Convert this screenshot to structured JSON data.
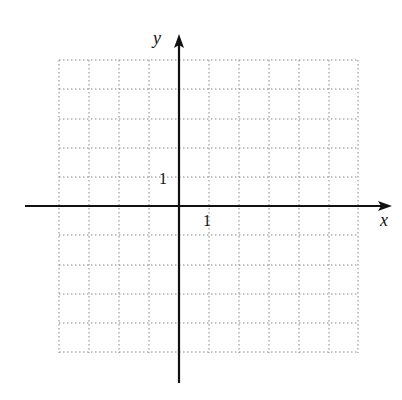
{
  "figure": {
    "type": "coordinate-grid",
    "axes": {
      "x_label": "x",
      "y_label": "y",
      "x_tick_label": "1",
      "y_tick_label": "1"
    },
    "grid": {
      "columns": 10,
      "rows": 10,
      "line_style": "dotted",
      "x_range": [
        -4,
        6
      ],
      "y_range": [
        -5,
        5
      ]
    },
    "colors": {
      "axis": "#111111",
      "grid": "#888888"
    }
  }
}
